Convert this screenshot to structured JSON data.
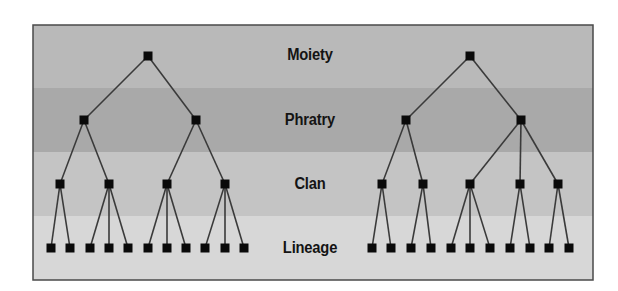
{
  "frame": {
    "x": 33,
    "y": 25,
    "width": 560,
    "height": 255,
    "border_color": "#4a4a4a"
  },
  "colors": {
    "node": "#0a0a0a",
    "edge": "#3a3a3a",
    "band_moiety": "#b9b9b9",
    "band_phratry": "#a9a9a9",
    "band_clan": "#c4c4c4",
    "band_lineage": "#d7d7d7"
  },
  "levels": [
    {
      "id": "moiety",
      "label": "Moiety",
      "band_top": 25,
      "band_bottom": 88,
      "y": 56
    },
    {
      "id": "phratry",
      "label": "Phratry",
      "band_top": 88,
      "band_bottom": 152,
      "y": 120
    },
    {
      "id": "clan",
      "label": "Clan",
      "band_top": 152,
      "band_bottom": 216,
      "y": 184
    },
    {
      "id": "lineage",
      "label": "Lineage",
      "band_top": 216,
      "band_bottom": 280,
      "y": 248
    }
  ],
  "trees": [
    {
      "name": "left-moiety",
      "moiety": {
        "x": 148
      },
      "phratries": [
        {
          "x": 84,
          "clans": [
            {
              "x": 60,
              "lineages": [
                51,
                70
              ]
            },
            {
              "x": 109,
              "lineages": [
                90,
                109,
                128
              ]
            }
          ]
        },
        {
          "x": 196,
          "clans": [
            {
              "x": 167,
              "lineages": [
                148,
                167,
                186
              ]
            },
            {
              "x": 225,
              "lineages": [
                205,
                225,
                244
              ]
            }
          ]
        }
      ]
    },
    {
      "name": "right-moiety",
      "moiety": {
        "x": 470
      },
      "phratries": [
        {
          "x": 406,
          "clans": [
            {
              "x": 382,
              "lineages": [
                372,
                391
              ]
            },
            {
              "x": 423,
              "lineages": [
                411,
                431
              ]
            }
          ]
        },
        {
          "x": 521,
          "clans": [
            {
              "x": 470,
              "lineages": [
                451,
                470,
                490
              ]
            },
            {
              "x": 520,
              "lineages": [
                510,
                530
              ]
            },
            {
              "x": 558,
              "lineages": [
                549,
                569
              ]
            }
          ]
        }
      ]
    }
  ],
  "node_size": 9
}
